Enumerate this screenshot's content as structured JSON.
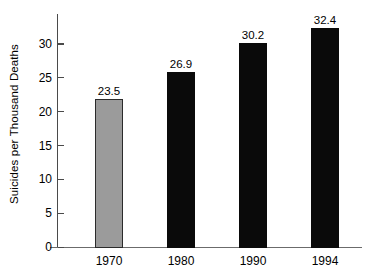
{
  "chart_data": {
    "type": "bar",
    "title": "",
    "subtitle": "",
    "xlabel": "",
    "ylabel": "Suicides per Thousand Deaths",
    "categories": [
      "1970",
      "1980",
      "1990",
      "1994"
    ],
    "values": [
      23.5,
      26.9,
      30.2,
      32.4
    ],
    "bar_heights_plotted": [
      22.0,
      26.0,
      30.2,
      32.4
    ],
    "data_labels": [
      "23.5",
      "26.9",
      "30.2",
      "32.4"
    ],
    "series": [
      {
        "name": "Suicides per Thousand Deaths",
        "values": [
          23.5,
          26.9,
          30.2,
          32.4
        ]
      }
    ],
    "bar_colors": [
      "#9b9b9b",
      "#0a0a0a",
      "#0a0a0a",
      "#0a0a0a"
    ],
    "ylim": [
      0,
      34.5
    ],
    "yticks": [
      0,
      5,
      10,
      15,
      20,
      25,
      30
    ],
    "ytick_labels": [
      "0",
      "5",
      "10",
      "15",
      "20",
      "25",
      "30"
    ],
    "grid": false,
    "legend": false,
    "legend_position": "none",
    "axis_color": "#4a4a4a",
    "text_color": "#000000",
    "background": "#ffffff"
  }
}
